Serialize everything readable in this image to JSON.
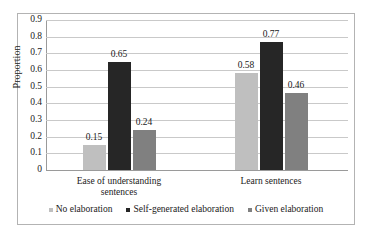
{
  "chart_data": {
    "type": "bar",
    "title": "",
    "subtitle": "",
    "xlabel": "",
    "ylabel": "Proportion",
    "ylim": [
      0,
      0.9
    ],
    "grid": true,
    "grid_axis": "y",
    "legend_position": "bottom",
    "categories": [
      "Ease of understanding sentences",
      "Learn sentences"
    ],
    "category_lines": [
      [
        "Ease of understanding",
        "sentences"
      ],
      [
        "Learn sentences"
      ]
    ],
    "y_ticks": [
      "0",
      "0.1",
      "0.2",
      "0.3",
      "0.4",
      "0.5",
      "0.6",
      "0.7",
      "0.8",
      "0.9"
    ],
    "y_tick_values": [
      0,
      0.1,
      0.2,
      0.3,
      0.4,
      0.5,
      0.6,
      0.7,
      0.8,
      0.9
    ],
    "series": [
      {
        "name": "No elaboration",
        "color": "#BFBFBF",
        "values": [
          0.15,
          0.58
        ],
        "labels": [
          "0.15",
          "0.58"
        ]
      },
      {
        "name": "Self-generated elaboration",
        "color": "#262626",
        "values": [
          0.65,
          0.77
        ],
        "labels": [
          "0.65",
          "0.77"
        ]
      },
      {
        "name": "Given elaboration",
        "color": "#808080",
        "values": [
          0.24,
          0.46
        ],
        "labels": [
          "0.24",
          "0.46"
        ]
      }
    ]
  },
  "colors": {
    "no_elaboration": "#BFBFBF",
    "self_generated_elaboration": "#262626",
    "given_elaboration": "#808080",
    "gridline": "#C9C9C9",
    "axis": "#9A9A9A",
    "border": "#B3B3B3",
    "text": "#1A1A1A",
    "background": "#FFFFFF"
  }
}
